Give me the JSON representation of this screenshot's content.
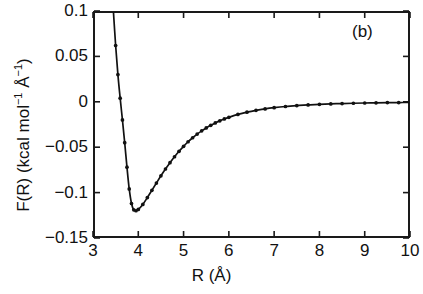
{
  "figure": {
    "panel_label": "(b)",
    "background_color": "#ffffff",
    "line_color": "#111111",
    "marker_color": "#111111"
  },
  "axes": {
    "x_title": "R (Å)",
    "y_title_main": "F(R) (kcal mol",
    "y_title_sup1": "−1",
    "y_title_mid": " Å",
    "y_title_sup2": "−1",
    "y_title_end": ")",
    "x_ticks": [
      "3",
      "4",
      "5",
      "6",
      "7",
      "8",
      "9",
      "10"
    ],
    "y_ticks": [
      "0.1",
      "0.05",
      "0",
      "−0.05",
      "−0.1",
      "−0.15"
    ]
  },
  "chart_data": {
    "type": "line",
    "title": "",
    "subtitle": "",
    "panel": "(b)",
    "xlabel": "R (Å)",
    "ylabel": "F(R) (kcal mol−1 Å−1)",
    "xlim": [
      3,
      10
    ],
    "ylim": [
      -0.15,
      0.1
    ],
    "xticks": [
      3,
      4,
      5,
      6,
      7,
      8,
      9,
      10
    ],
    "yticks": [
      0.1,
      0.05,
      0,
      -0.05,
      -0.1,
      -0.15
    ],
    "grid": false,
    "legend": null,
    "annotations": [
      {
        "text": "(b)",
        "x": 9.4,
        "y": 0.085
      }
    ],
    "series": [
      {
        "name": "F(R)",
        "style": "line-with-dot-markers",
        "marker": "dot",
        "x": [
          3.45,
          3.5,
          3.55,
          3.6,
          3.65,
          3.7,
          3.75,
          3.8,
          3.85,
          3.9,
          3.95,
          4.0,
          4.1,
          4.2,
          4.3,
          4.4,
          4.5,
          4.6,
          4.7,
          4.8,
          4.9,
          5.0,
          5.1,
          5.2,
          5.3,
          5.4,
          5.5,
          5.6,
          5.7,
          5.8,
          5.9,
          6.0,
          6.2,
          6.4,
          6.6,
          6.8,
          7.0,
          7.25,
          7.5,
          7.75,
          8.0,
          8.25,
          8.5,
          8.75,
          9.0,
          9.25,
          9.5,
          9.75,
          10.0
        ],
        "y": [
          0.1,
          0.062,
          0.03,
          0.004,
          -0.02,
          -0.045,
          -0.072,
          -0.096,
          -0.112,
          -0.119,
          -0.12,
          -0.1185,
          -0.113,
          -0.1055,
          -0.0975,
          -0.0895,
          -0.0815,
          -0.074,
          -0.067,
          -0.0605,
          -0.0545,
          -0.049,
          -0.044,
          -0.0396,
          -0.0356,
          -0.032,
          -0.0288,
          -0.0259,
          -0.0233,
          -0.021,
          -0.0189,
          -0.0171,
          -0.0139,
          -0.0114,
          -0.0094,
          -0.0078,
          -0.0065,
          -0.0052,
          -0.0042,
          -0.0034,
          -0.0028,
          -0.0023,
          -0.0019,
          -0.0016,
          -0.0013,
          -0.0011,
          -0.0009,
          -0.0008,
          -0.0007
        ]
      }
    ]
  }
}
